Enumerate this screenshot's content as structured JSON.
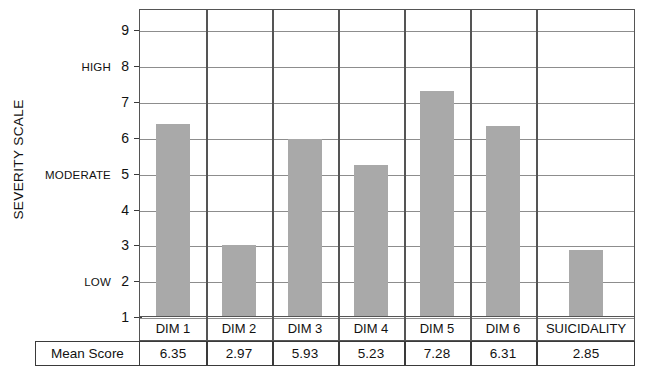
{
  "chart_data": {
    "type": "bar",
    "title": "",
    "xlabel": "",
    "ylabel": "SEVERITY SCALE",
    "ylim": [
      1,
      9.6
    ],
    "grid": true,
    "legend": "none",
    "categories": [
      "DIM 1",
      "DIM 2",
      "DIM 3",
      "DIM 4",
      "DIM 5",
      "DIM 6",
      "SUICIDALITY"
    ],
    "values": [
      6.35,
      2.97,
      5.93,
      5.23,
      7.28,
      6.31,
      2.85
    ],
    "value_labels": [
      "6.35",
      "2.97",
      "5.93",
      "5.23",
      "7.28",
      "6.31",
      "2.85"
    ],
    "yticks": [
      1,
      2,
      3,
      4,
      5,
      6,
      7,
      8,
      9
    ],
    "ytick_labels": [
      "1",
      "2",
      "3",
      "4",
      "5",
      "6",
      "7",
      "8",
      "9"
    ],
    "band_labels": [
      {
        "value": 8,
        "text": "HIGH"
      },
      {
        "value": 5,
        "text": "MODERATE"
      },
      {
        "value": 2,
        "text": "LOW"
      }
    ],
    "bar_color": "#a9a9a9",
    "grid_color": "#8d8d8d",
    "frame_color": "#555555"
  },
  "table": {
    "row_label": "Mean Score",
    "columns": [
      "DIM 1",
      "DIM 2",
      "DIM 3",
      "DIM 4",
      "DIM 5",
      "DIM 6",
      "SUICIDALITY"
    ],
    "values": [
      "6.35",
      "2.97",
      "5.93",
      "5.23",
      "7.28",
      "6.31",
      "2.85"
    ]
  }
}
